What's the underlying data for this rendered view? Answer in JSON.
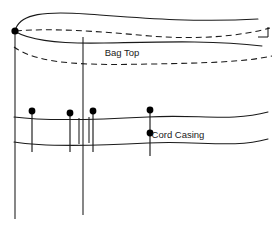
{
  "diagram": {
    "type": "sewing-construction-diagram",
    "canvas": {
      "width": 276,
      "height": 225
    },
    "colors": {
      "background": "#ffffff",
      "line": "#1a1a1a",
      "pin": "#000000",
      "text": "#1a1a1a"
    },
    "labels": {
      "bag_top": "Bag Top",
      "cord_casing": "Cord Casing"
    },
    "label_positions": {
      "bag_top": {
        "x": 122,
        "y": 53
      },
      "cord_casing": {
        "x": 178,
        "y": 135
      }
    },
    "vertical_seams": [
      {
        "name": "left-side-seam",
        "x": 15,
        "y_top": 31,
        "y_bottom": 219
      },
      {
        "name": "center-side-seam",
        "x": 83,
        "y_top": 37,
        "y_bottom": 215
      }
    ],
    "corner_marker": {
      "x": 15,
      "y": 31,
      "r": 3.6
    },
    "right_edge_tick": {
      "x": 268,
      "y_top": 27,
      "y_bottom": 37,
      "x_end": 258
    },
    "curves": {
      "bag_top_outer": {
        "style": "solid",
        "path": "M 16 28 C 22 14, 44 11, 86 14 C 130 17, 190 23, 258 19"
      },
      "bag_top_dashed_upper": {
        "style": "dashed",
        "path": "M 16 31 C 50 28, 96 31, 150 36 C 200 40, 240 36, 270 28"
      },
      "bag_top_fold_solid": {
        "style": "solid",
        "path": "M 16 32 C 30 40, 58 44, 104 43 C 160 42, 212 40, 262 46"
      },
      "bag_top_dashed_lower": {
        "style": "dashed",
        "path": "M 14 47 C 40 66, 96 65, 152 64 C 206 63, 244 62, 272 56"
      },
      "casing_top": {
        "style": "solid",
        "path": "M 14 117 C 44 121, 92 120, 148 117 C 196 114, 232 122, 268 112"
      },
      "casing_bottom": {
        "style": "solid",
        "path": "M 14 142 C 44 147, 92 146, 148 143 C 196 140, 232 149, 268 139"
      }
    },
    "casing_box_left": {
      "name": "casing-box-left",
      "x_left": 15,
      "x_right": 79,
      "y_top": 118,
      "y_bottom": 144
    },
    "casing_box_right": {
      "name": "casing-box-right",
      "x_left": 89,
      "x_right": 155,
      "y_top": 117,
      "y_bottom": 143
    },
    "casing_opening_gap": {
      "x_left": 79,
      "x_right": 89
    },
    "pins": [
      {
        "id": "pin-left-1",
        "x": 32,
        "head_y": 111,
        "tail_y": 152
      },
      {
        "id": "pin-left-2",
        "x": 70,
        "head_y": 113,
        "tail_y": 152
      },
      {
        "id": "pin-right-1",
        "x": 93,
        "head_y": 111,
        "tail_y": 152
      },
      {
        "id": "pin-right-2",
        "x": 150,
        "head_y": 110,
        "tail_y": 156
      },
      {
        "id": "pin-right-3",
        "x": 150,
        "head_y": 133,
        "tail_y": 156
      }
    ],
    "pin_head_radius": 3.4
  }
}
